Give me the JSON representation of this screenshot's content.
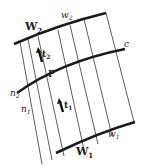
{
  "diagram": {
    "labels": {
      "W2": "W",
      "W2_sub": "2",
      "w2": "w",
      "w2_sub": "2",
      "t2": "t",
      "t2_sub": "2",
      "P": "P",
      "c": "c",
      "n2": "n",
      "n2_sub": "2",
      "n1": "n",
      "n1_sub": "1",
      "t1": "t",
      "t1_sub": "1",
      "w1": "w",
      "w1_sub": "1",
      "W1": "W",
      "W1_sub": "1"
    },
    "colors": {
      "line": "#222222",
      "background": "#ffffff"
    }
  }
}
